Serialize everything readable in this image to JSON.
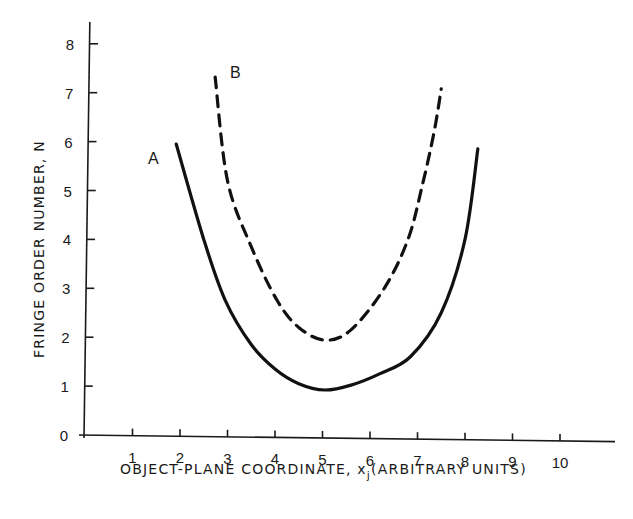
{
  "chart_data": {
    "type": "line",
    "title": "",
    "xlabel": "OBJECT-PLANE COORDINATE, x",
    "xlabel_subscript": "j",
    "xlabel_suffix": "(ARBITRARY UNITS)",
    "ylabel": "FRINGE ORDER NUMBER, N",
    "xlim": [
      0,
      11.2
    ],
    "ylim": [
      0,
      8.6
    ],
    "xticks": [
      1,
      2,
      3,
      4,
      5,
      6,
      7,
      8,
      9,
      10
    ],
    "yticks": [
      0,
      1,
      2,
      3,
      4,
      5,
      6,
      7,
      8
    ],
    "grid": false,
    "legend": "inline curve labels",
    "series": [
      {
        "name": "A",
        "style": "solid",
        "x": [
          1.92,
          2.5,
          2.95,
          3.5,
          4.0,
          4.5,
          5.05,
          5.6,
          6.2,
          6.85,
          7.5,
          8.0,
          8.27
        ],
        "y": [
          5.95,
          4.0,
          2.76,
          1.85,
          1.35,
          1.05,
          0.92,
          1.02,
          1.25,
          1.6,
          2.5,
          4.0,
          5.85
        ]
      },
      {
        "name": "B",
        "style": "dashed",
        "x": [
          2.74,
          3.0,
          3.5,
          4.04,
          4.5,
          5.05,
          5.6,
          6.3,
          6.8,
          7.1,
          7.35,
          7.5
        ],
        "y": [
          7.32,
          5.2,
          3.85,
          2.76,
          2.2,
          1.94,
          2.15,
          3.0,
          4.0,
          5.1,
          6.2,
          7.08
        ]
      }
    ]
  }
}
